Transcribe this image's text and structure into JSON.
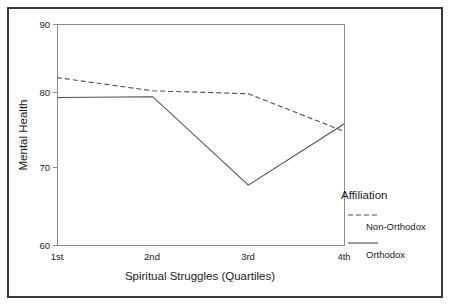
{
  "chart_data": {
    "type": "line",
    "title": "",
    "xlabel": "Spiritual Struggles (Quartiles)",
    "ylabel": "Mental Health",
    "categories": [
      "1st",
      "2nd",
      "3rd",
      "4th"
    ],
    "ylim": [
      60,
      90
    ],
    "yticks": [
      60,
      70,
      80,
      90
    ],
    "ytick_labels": [
      "60",
      "70",
      "80",
      "90"
    ],
    "grid": false,
    "legend_position": "right",
    "legend_title": "Affiliation",
    "series": [
      {
        "name": "Non-Orthodox",
        "style": "dashed",
        "values": [
          82.8,
          81.0,
          80.6,
          75.5
        ]
      },
      {
        "name": "Orthodox",
        "style": "solid",
        "values": [
          80.1,
          80.2,
          68.2,
          76.5
        ]
      }
    ]
  },
  "axes": {
    "y_title": "Mental Health",
    "x_title": "Spiritual Struggles (Quartiles)",
    "y_tick_0": "60",
    "y_tick_1": "70",
    "y_tick_2": "80",
    "y_tick_3": "90",
    "x_tick_0": "1st",
    "x_tick_1": "2nd",
    "x_tick_2": "3rd",
    "x_tick_3": "4th"
  },
  "legend": {
    "title": "Affiliation",
    "entry_0_label": "Non-Orthodox",
    "entry_1_label": "Orthodox"
  },
  "colors": {
    "line": "#4d4d4d",
    "frame": "#8c8c8c",
    "border": "#3a3a3a",
    "text": "#1a1a1a",
    "background": "#ffffff"
  }
}
